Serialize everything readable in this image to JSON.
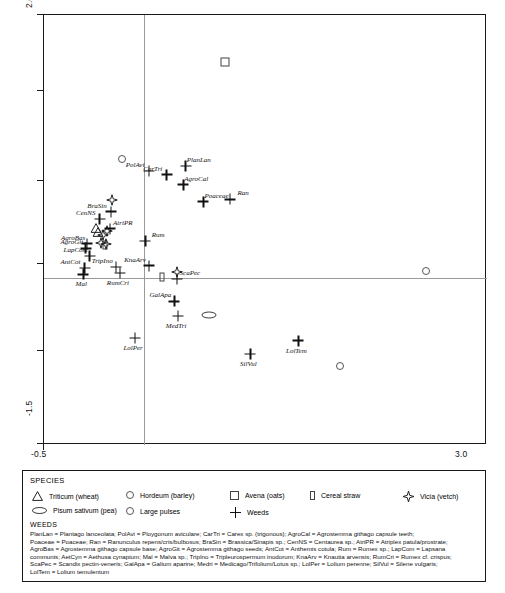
{
  "chart_data": {
    "type": "scatter",
    "title": "",
    "xlabel": "",
    "ylabel": "",
    "xlim": [
      -0.5,
      3.0
    ],
    "ylim": [
      -1.5,
      2.0
    ],
    "xticks": [
      "-0.5",
      "3.0"
    ],
    "yticks": [
      "2.0",
      "-1.5"
    ],
    "grid": false,
    "zero_lines": true,
    "legend_position": "below-plot",
    "series": [
      {
        "name": "Triticum (wheat)",
        "symbol": "triangle",
        "points": [
          {
            "label": "",
            "x": -0.09,
            "y": 0.3
          },
          {
            "label": "",
            "x": -0.07,
            "y": 0.27
          }
        ]
      },
      {
        "name": "Hordeum (barley)",
        "symbol": "circle",
        "points": [
          {
            "label": "",
            "x": 0.12,
            "y": 0.83
          },
          {
            "label": "",
            "x": 2.52,
            "y": -0.08
          },
          {
            "label": "",
            "x": 1.84,
            "y": -0.86
          }
        ]
      },
      {
        "name": "Avena (oats)",
        "symbol": "square",
        "points": [
          {
            "label": "",
            "x": 0.93,
            "y": 1.62
          }
        ]
      },
      {
        "name": "Cereal straw",
        "symbol": "rect",
        "points": [
          {
            "label": "",
            "x": -0.02,
            "y": 0.13
          },
          {
            "label": "",
            "x": 0.43,
            "y": -0.13
          }
        ]
      },
      {
        "name": "Vicia (vetch)",
        "symbol": "star",
        "points": [
          {
            "label": "",
            "x": 0.04,
            "y": 0.52
          },
          {
            "label": "",
            "x": 0.0,
            "y": 0.27
          },
          {
            "label": "",
            "x": -0.03,
            "y": 0.23
          },
          {
            "label": "",
            "x": -0.05,
            "y": 0.17
          },
          {
            "label": "",
            "x": -0.01,
            "y": 0.16
          },
          {
            "label": "",
            "x": 0.55,
            "y": -0.07
          }
        ]
      },
      {
        "name": "Pisum sativum (pea)",
        "symbol": "ellipse",
        "points": [
          {
            "label": "",
            "x": 0.8,
            "y": -0.44
          }
        ]
      },
      {
        "name": "Large pulses",
        "symbol": "circle",
        "points": []
      },
      {
        "name": "Weeds",
        "symbol": "plus",
        "points": [
          {
            "label": "PolAvi",
            "x": 0.33,
            "y": 0.73
          },
          {
            "label": "CarTri",
            "x": 0.47,
            "y": 0.7
          },
          {
            "label": "PlanLan",
            "x": 0.62,
            "y": 0.77
          },
          {
            "label": "AgroCal",
            "x": 0.6,
            "y": 0.62
          },
          {
            "label": "Poaceae",
            "x": 0.76,
            "y": 0.48
          },
          {
            "label": "Ran",
            "x": 0.97,
            "y": 0.5
          },
          {
            "label": "BraSin",
            "x": 0.03,
            "y": 0.4
          },
          {
            "label": "CenNS",
            "x": -0.06,
            "y": 0.34
          },
          {
            "label": "AtriPR",
            "x": 0.02,
            "y": 0.26
          },
          {
            "label": "AgroBas",
            "x": -0.16,
            "y": 0.14
          },
          {
            "label": "AgroGit",
            "x": -0.17,
            "y": 0.1
          },
          {
            "label": "LapCom",
            "x": -0.14,
            "y": 0.04
          },
          {
            "label": "AntCot",
            "x": -0.18,
            "y": -0.06
          },
          {
            "label": "Mal",
            "x": -0.19,
            "y": -0.11
          },
          {
            "label": "TripIno",
            "x": 0.07,
            "y": -0.05
          },
          {
            "label": "RumCri",
            "x": 0.1,
            "y": -0.1
          },
          {
            "label": "Rum",
            "x": 0.3,
            "y": 0.16
          },
          {
            "label": "KnaArv",
            "x": 0.33,
            "y": -0.04
          },
          {
            "label": "ScaPec",
            "x": 0.55,
            "y": -0.15
          },
          {
            "label": "GalApa",
            "x": 0.53,
            "y": -0.33
          },
          {
            "label": "MedTri",
            "x": 0.56,
            "y": -0.45
          },
          {
            "label": "LolPer",
            "x": 0.22,
            "y": -0.63
          },
          {
            "label": "SilVul",
            "x": 1.13,
            "y": -0.76
          },
          {
            "label": "LolTem",
            "x": 1.51,
            "y": -0.65
          }
        ]
      }
    ]
  },
  "legend": {
    "title": "SPECIES",
    "row1": [
      {
        "symbol": "triangle",
        "label": "Triticum (wheat)"
      },
      {
        "symbol": "circle",
        "label": "Hordeum (barley)"
      },
      {
        "symbol": "square",
        "label": "Avena (oats)"
      },
      {
        "symbol": "rect",
        "label": "Cereal straw"
      },
      {
        "symbol": "star",
        "label": "Vicia (vetch)"
      }
    ],
    "row2": [
      {
        "symbol": "ellipse",
        "label": "Pisum sativum (pea)"
      },
      {
        "symbol": "circle",
        "label": "Large pulses"
      },
      {
        "symbol": "plus",
        "label": "Weeds"
      }
    ],
    "weeds_heading": "WEEDS",
    "weeds_lines": [
      "PlanLan = Plantago lanceolata; PolAvi = Ploygonum aviculare; CarTri = Carex sp. (trigonous); AgroCal = Agrostemma githago capsule teeth;",
      "Poaceae = Poaceae; Ran = Ranunculus repens/cris/bulbosus; BraSin = Brassica/Sinapis sp.; CenNS = Centaurea sp.; AtriPR = Atriplex patula/prostrate;",
      "AgroBas = Agrostemma githago capsule base; AgroGit = Agrostemma githago seeds; AntCot = Anthemis cotula; Rum = Rumex sp.; LapCom = Lapsana",
      "communis; AetCyn = Aethusa cynapium; Mal = Malva sp.; TripIno = Tripleurospermum inodorum; KnaArv = Knautia arvensis; RumCri = Rumex cf. crispus;",
      "ScaPec = Scandix pectin-veneris; GalApa = Galium aparine; Medri = Medicago/Trifolium/Lotus sp.; LolPer = Lolium perenne; SilVul = Silene vulgaris;",
      "LolTem = Lolium temulentum"
    ]
  }
}
